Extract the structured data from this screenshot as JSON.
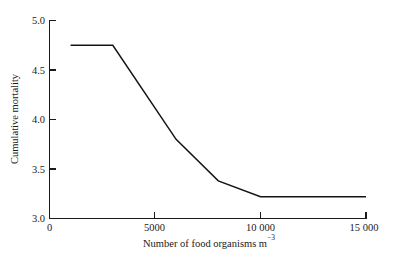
{
  "chart_data": {
    "type": "line",
    "title": "",
    "xlabel": "Number of food organisms m",
    "xlabel_exponent": "−3",
    "xlabel_full": "Number of food organisms m−3",
    "ylabel": "Cumulative mortality",
    "xlim": [
      0,
      15000
    ],
    "ylim": [
      3.0,
      5.0
    ],
    "grid": false,
    "legend": null,
    "x_ticks": [
      0,
      5000,
      10000,
      15000
    ],
    "x_tick_labels": [
      "0",
      "5000",
      "10 000",
      "15 000"
    ],
    "y_ticks": [
      3.0,
      3.5,
      4.0,
      4.5,
      5.0
    ],
    "y_tick_labels": [
      "3.0",
      "3.5",
      "4.0",
      "4.5",
      "5.0"
    ],
    "series": [
      {
        "name": "Cumulative mortality",
        "color": "#141414",
        "x": [
          1000,
          3000,
          6000,
          8000,
          10000,
          15000
        ],
        "values": [
          4.75,
          4.75,
          3.8,
          3.38,
          3.22,
          3.22
        ]
      }
    ]
  },
  "figure": {
    "background_color": "#ffffff",
    "axis_color": "#1a1a1a",
    "line_color": "#141414"
  }
}
